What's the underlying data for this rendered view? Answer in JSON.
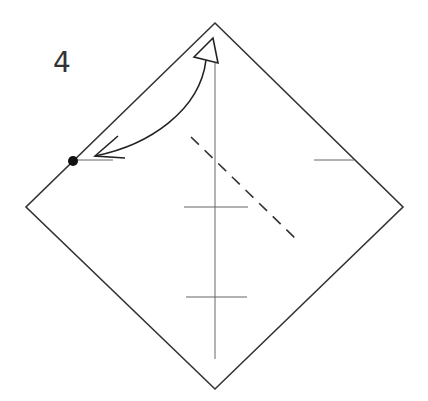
{
  "diagram": {
    "type": "origami-step",
    "step_number": "4",
    "colors": {
      "outline": "#333333",
      "crease": "#666666",
      "dashed_fold": "#333333",
      "arrow": "#222222",
      "dot": "#111111",
      "background": "#ffffff"
    },
    "paper_square": {
      "shape": "diamond",
      "vertices": {
        "top": [
          215,
          23
        ],
        "right": [
          403,
          207
        ],
        "bottom": [
          215,
          389
        ],
        "left": [
          26,
          207
        ]
      }
    },
    "creases": [
      {
        "name": "vertical-center-crease",
        "from": [
          215,
          63
        ],
        "to": [
          215,
          359
        ]
      },
      {
        "name": "center-tick",
        "from": [
          184,
          207
        ],
        "to": [
          248,
          207
        ]
      },
      {
        "name": "lower-tick",
        "from": [
          186,
          297
        ],
        "to": [
          247,
          297
        ]
      },
      {
        "name": "right-edge-tick",
        "from": [
          314,
          160
        ],
        "to": [
          354,
          160
        ]
      },
      {
        "name": "left-dot-tick",
        "from": [
          73,
          160
        ],
        "to": [
          113,
          160
        ]
      }
    ],
    "valley_fold_line": {
      "style": "dashed",
      "from": [
        191,
        137
      ],
      "to": [
        297,
        240
      ]
    },
    "reference_dot": {
      "center": [
        73,
        161
      ],
      "radius": 5
    },
    "fold_arrow": {
      "description": "Bring top corner down to the marked dot",
      "start_hollow_head": {
        "tip": [
          213,
          38
        ],
        "left": [
          194,
          57
        ],
        "right": [
          218,
          63
        ]
      },
      "curve_path": "M206,60 C200,110 150,145 95,156",
      "end_barbs": {
        "tip": [
          95,
          156
        ],
        "upper": [
          118,
          136
        ],
        "lower": [
          125,
          158
        ]
      }
    }
  }
}
